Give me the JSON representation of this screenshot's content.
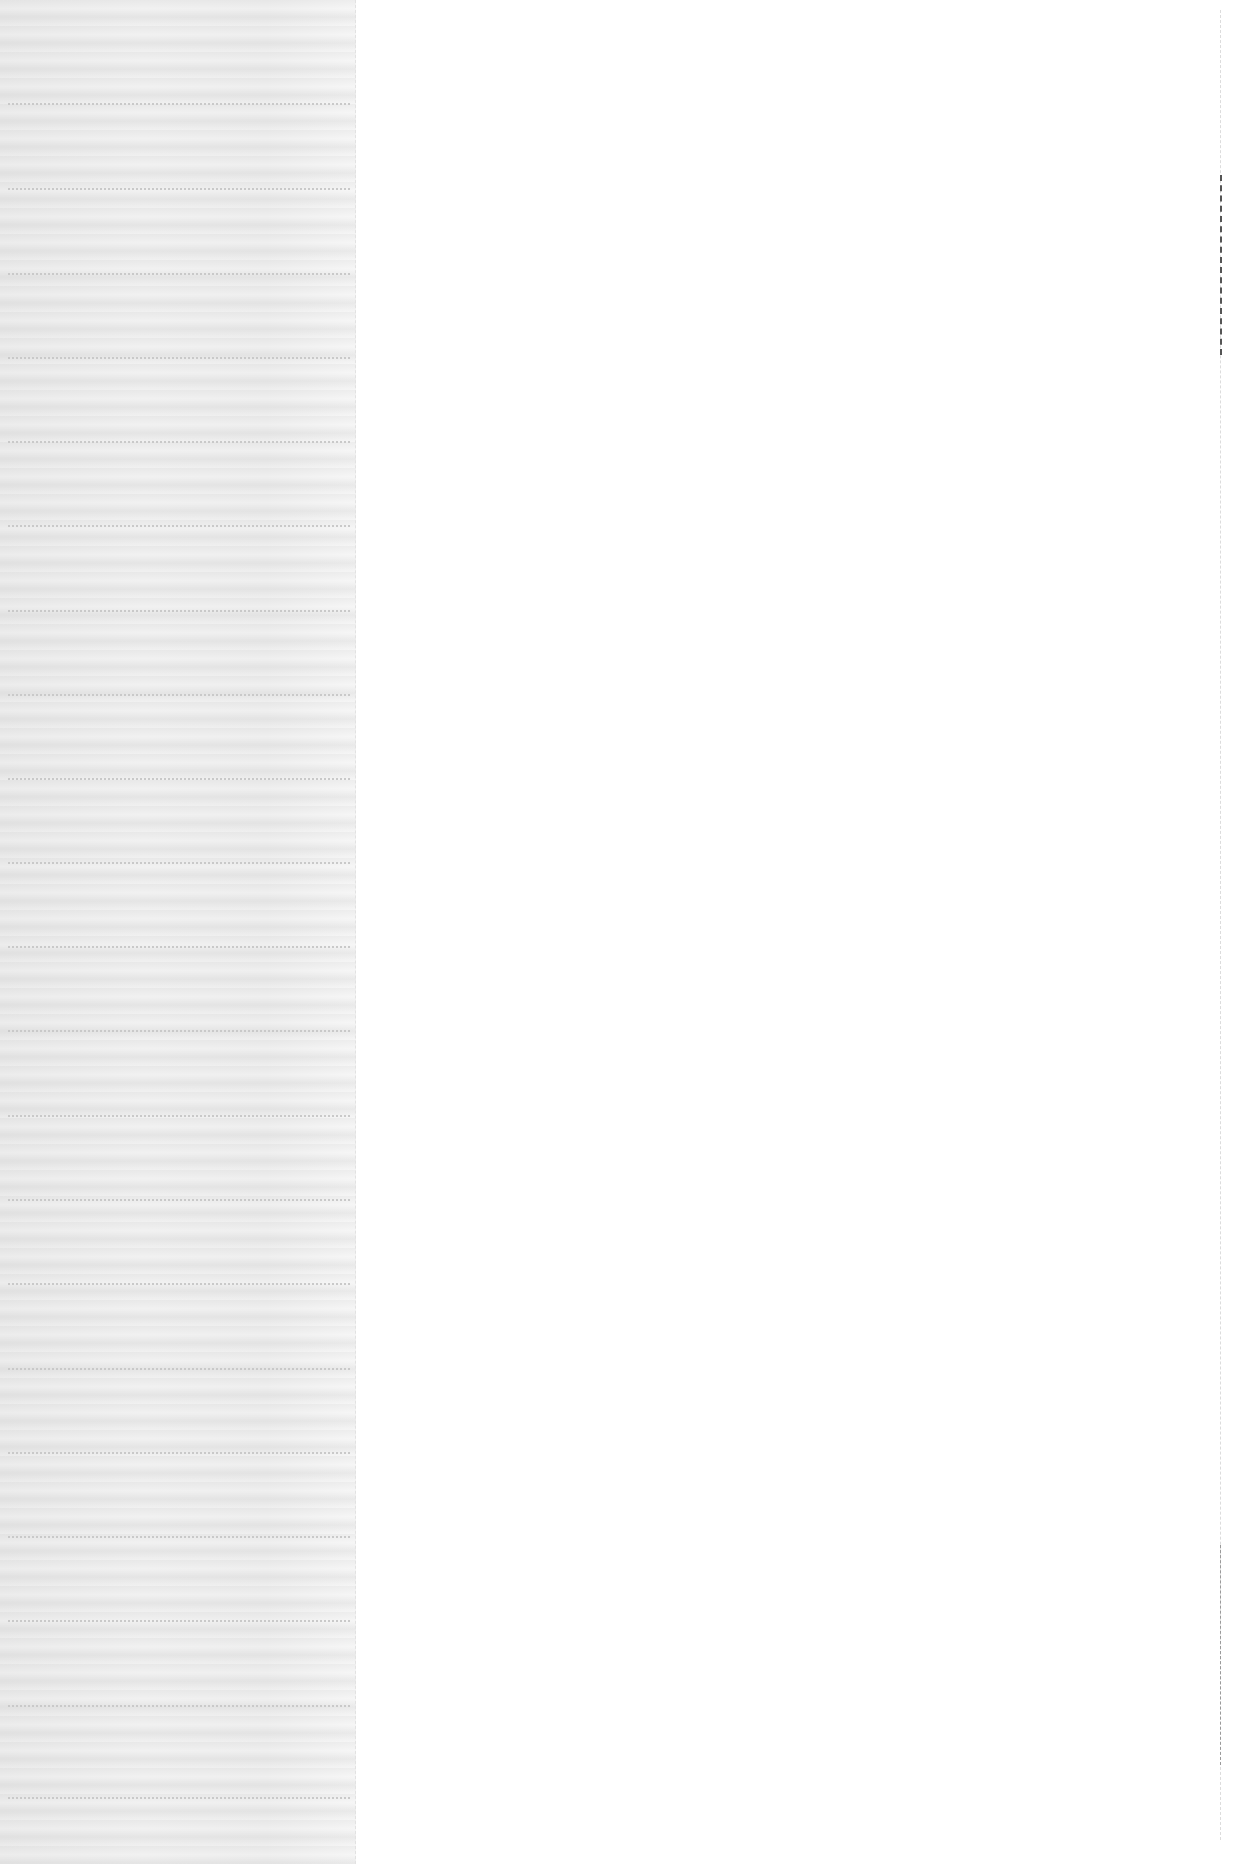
{
  "page": {
    "background_color": "#ffffff",
    "margin_strip_color": "#eeeeee",
    "rule_color": "#c9c9c9",
    "rule_count": 21
  }
}
